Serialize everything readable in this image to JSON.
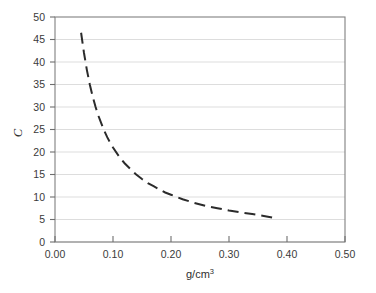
{
  "chart_data": {
    "type": "line",
    "title": "",
    "subtitle": "",
    "xlabel": "g/cm3",
    "xlabel_base": "g/cm",
    "xlabel_sup": "3",
    "ylabel": "C",
    "xlim": [
      0.0,
      0.5
    ],
    "ylim": [
      0,
      50
    ],
    "grid": "horizontal",
    "legend": "none",
    "line_style": "dashed",
    "line_color": "#2b2b2b",
    "grid_color": "#d9d9d9",
    "frame_color": "#808080",
    "background_color": "#ffffff",
    "xticks": [
      0.0,
      0.1,
      0.2,
      0.3,
      0.4,
      0.5
    ],
    "xtick_labels": [
      "0.00",
      "0.10",
      "0.20",
      "0.30",
      "0.40",
      "0.50"
    ],
    "yticks": [
      0,
      5,
      10,
      15,
      20,
      25,
      30,
      35,
      40,
      45,
      50
    ],
    "ytick_labels": [
      "0",
      "5",
      "10",
      "15",
      "20",
      "25",
      "30",
      "35",
      "40",
      "45",
      "50"
    ],
    "series": [
      {
        "name": "C vs density",
        "x": [
          0.045,
          0.05,
          0.055,
          0.06,
          0.065,
          0.07,
          0.075,
          0.08,
          0.085,
          0.09,
          0.095,
          0.1,
          0.11,
          0.12,
          0.13,
          0.14,
          0.15,
          0.16,
          0.17,
          0.18,
          0.19,
          0.2,
          0.22,
          0.24,
          0.26,
          0.28,
          0.3,
          0.32,
          0.34,
          0.36,
          0.38
        ],
        "y": [
          46.5,
          42.0,
          38.2,
          35.0,
          32.3,
          30.0,
          28.0,
          26.3,
          24.7,
          23.3,
          22.1,
          21.0,
          19.1,
          17.5,
          16.2,
          15.0,
          14.0,
          13.1,
          12.4,
          11.7,
          11.0,
          10.5,
          9.5,
          8.7,
          8.0,
          7.5,
          7.0,
          6.6,
          6.2,
          5.8,
          5.3
        ]
      }
    ]
  }
}
